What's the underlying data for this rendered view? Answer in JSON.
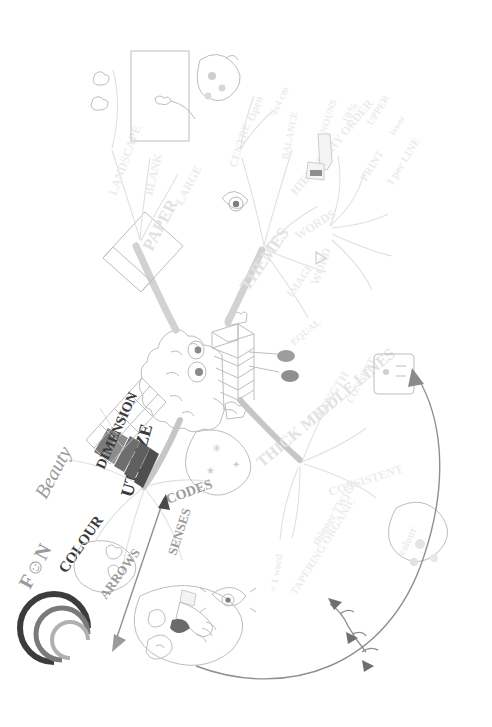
{
  "document": {
    "kind": "hand-drawn mind map",
    "title": "Mind Map Laws",
    "orientation": "rotated 90 degrees (text reads bottom-to-top / sideways)",
    "background_color": "#ffffff",
    "ink_colors": {
      "light_gray": "#e0e0e0",
      "mid_gray": "#bdbdbd",
      "dark_gray": "#3a3a3a",
      "branch_gray": "#d2d2d2"
    }
  },
  "center": {
    "label": "",
    "image_name": "cartoon-brain-holding-folded-paper"
  },
  "branches": [
    {
      "id": "paper",
      "label": "PAPER",
      "emphasis": "main",
      "children": [
        {
          "label": "LANDSCAPE",
          "children": []
        },
        {
          "label": "BLANK",
          "children": []
        },
        {
          "label": "LARGE",
          "children": []
        }
      ],
      "images": [
        "blank-landscape-sheet-icon",
        "paper-sheet-icon"
      ]
    },
    {
      "id": "themes",
      "label": "THEMES",
      "emphasis": "main",
      "children": [
        {
          "label": "CENTRE",
          "children": [
            {
              "label": "Open"
            },
            {
              "label": "4x4 cm"
            }
          ]
        },
        {
          "label": "BALANCE",
          "children": []
        },
        {
          "label": "HIERARCHY ORDER",
          "children": []
        },
        {
          "label": "WORDS",
          "children": [
            {
              "label": "NOUNS"
            },
            {
              "label": "10%"
            },
            {
              "label": "UPPER"
            },
            {
              "label": "PRINT"
            },
            {
              "label": "lower"
            },
            {
              "label": "1 per LINE"
            }
          ]
        },
        {
          "label": "IMAGE",
          "children": []
        },
        {
          "label": "WORD",
          "children": []
        },
        {
          "label": "EQUAL",
          "children": []
        }
      ],
      "images": [
        "eye-icon",
        "pen-writing-icon"
      ]
    },
    {
      "id": "lines",
      "label": "THICK MIDDLE LINES",
      "emphasis": "main",
      "children": [
        {
          "label": "LENGTH",
          "children": [
            {
              "label": "= 1 word"
            }
          ]
        },
        {
          "label": "CONNECT",
          "children": []
        },
        {
          "label": "CONSISTENT",
          "children": [
            {
              "label": "colour"
            }
          ]
        },
        {
          "label": "thinner TWIGS",
          "children": []
        },
        {
          "label": "TAPERING ORGANIC",
          "children": []
        }
      ],
      "images": [
        "branching-twig-icon",
        "colour-blobs-icon"
      ]
    },
    {
      "id": "utilize",
      "label": "UTILIZE",
      "emphasis": "main",
      "children": [
        {
          "label": "DIMENSION",
          "children": []
        },
        {
          "label": "CODES",
          "children": []
        },
        {
          "label": "COLOUR",
          "children": []
        },
        {
          "label": "ARROWS",
          "children": []
        },
        {
          "label": "SENSES",
          "children": []
        },
        {
          "label": "F☺N",
          "children": []
        },
        {
          "label": "Beauty",
          "children": []
        }
      ],
      "images": [
        "3d-bar-blocks-icon",
        "grid-mesh-icon",
        "rainbow-arc-icon",
        "arrow-icon",
        "hand-icon",
        "nose-icon",
        "mouth-icon",
        "ear-icon",
        "eye-icon",
        "smiley-face-icon"
      ]
    }
  ],
  "annotations": [
    {
      "name": "large-curved-arrow",
      "description": "long curved arrow sweeping from bottom-left up to the right-hand branch"
    }
  ],
  "labels": {
    "paper": "PAPER",
    "landscape": "LANDSCAPE",
    "blank": "BLANK",
    "large": "LARGE",
    "themes": "THEMES",
    "centre": "CENTRE",
    "open": "Open",
    "size": "4x4 cm",
    "balance": "BALANCE",
    "hierarchy": "HIERARCHY ORDER",
    "words": "WORDS",
    "nouns": "NOUNS",
    "ten_percent": "10%",
    "upper": "UPPER",
    "print": "PRINT",
    "lower": "lower",
    "one_per_line": "1 per LINE",
    "image": "IMAGE",
    "word": "WORD",
    "equal": "EQUAL",
    "lines": "THICK MIDDLE LINES",
    "length": "LENGTH",
    "length_sub": "= 1 word",
    "connect": "CONNECT",
    "consistent": "CONSISTENT",
    "colour_small": "colour",
    "twigs": "thinner TWIGS",
    "tapering": "TAPERING ORGANIC",
    "utilize": "UTILIZE",
    "dimension": "DIMENSION",
    "codes": "CODES",
    "colour": "COLOUR",
    "arrows": "ARROWS",
    "senses": "SENSES",
    "fun": "F☺N",
    "beauty": "Beauty"
  }
}
